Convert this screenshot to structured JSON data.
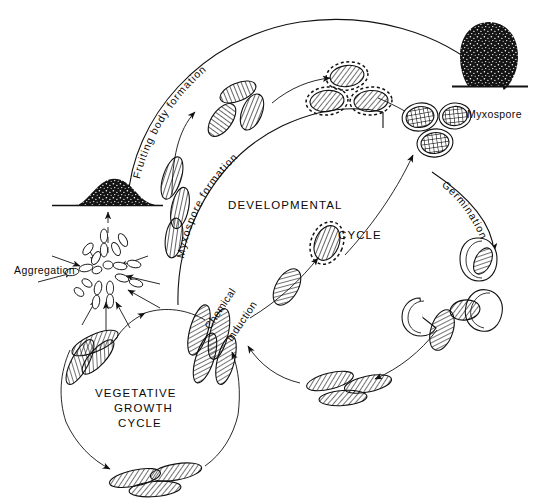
{
  "figure": {
    "background_color": "#ffffff",
    "ink_color": "#111111"
  },
  "labels": {
    "fruiting_body_formation": "Fruiting body formation",
    "myxospore_formation": "Myxospore formation",
    "developmental": "DEVELOPMENTAL",
    "cycle": "CYCLE",
    "myxospore": "Myxospore",
    "germination": "Germination",
    "aggregation": "Aggregation",
    "chemical": "Chemical",
    "induction": "induction",
    "vegetative": "VEGETATIVE",
    "growth": "GROWTH",
    "vegetative_cycle": "CYCLE"
  },
  "stages": [
    {
      "name": "swarm-of-vegetative-rods",
      "label": ""
    },
    {
      "name": "aggregation-starburst",
      "label": "Aggregation"
    },
    {
      "name": "aggregate-mound",
      "label": ""
    },
    {
      "name": "elongating-rods",
      "label": ""
    },
    {
      "name": "shortened-rods",
      "label": ""
    },
    {
      "name": "coat-forming-cells",
      "label": ""
    },
    {
      "name": "mature-myxospores",
      "label": "Myxospore"
    },
    {
      "name": "fruiting-body",
      "label": ""
    },
    {
      "name": "germinating-myxospore",
      "label": "Germination"
    },
    {
      "name": "emerging-rod",
      "label": ""
    },
    {
      "name": "chemically-induced-cell",
      "label": "Chemical induction"
    }
  ],
  "icon_names": [
    "fruiting-body-icon",
    "aggregate-mound-icon",
    "myxospore-icon",
    "vegetative-rod-icon",
    "arrow-icon"
  ]
}
